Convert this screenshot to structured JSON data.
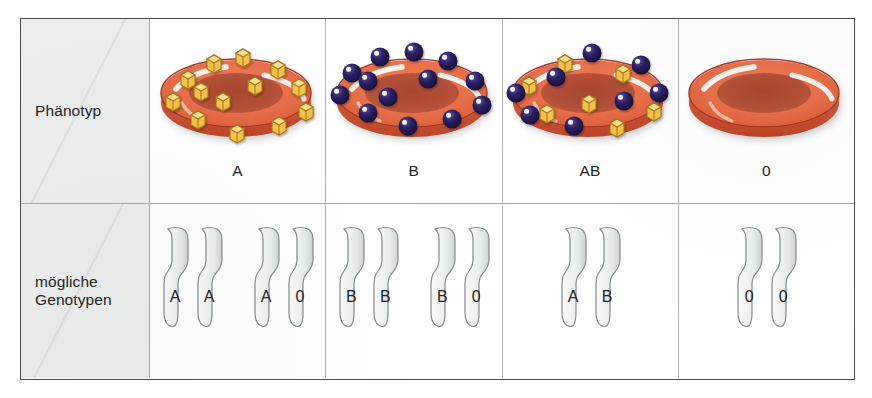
{
  "figure": {
    "rows": [
      {
        "key": "phenotype",
        "label": "Phänotyp"
      },
      {
        "key": "genotype",
        "label": "mögliche\nGenotypen"
      }
    ],
    "row_labels": {
      "phenotype": "Phänotyp",
      "genotype_line1": "mögliche",
      "genotype_line2": "Genotypen"
    },
    "columns": [
      {
        "phenotype": "A",
        "cell_icon": "red-blood-cell-with-a-antigens",
        "antigens": {
          "cubes": 12,
          "spheres": 0
        },
        "genotypes": [
          {
            "alleles": [
              "A",
              "A"
            ]
          },
          {
            "alleles": [
              "A",
              "0"
            ]
          }
        ]
      },
      {
        "phenotype": "B",
        "cell_icon": "red-blood-cell-with-b-antigens",
        "antigens": {
          "cubes": 0,
          "spheres": 13
        },
        "genotypes": [
          {
            "alleles": [
              "B",
              "B"
            ]
          },
          {
            "alleles": [
              "B",
              "0"
            ]
          }
        ]
      },
      {
        "phenotype": "AB",
        "cell_icon": "red-blood-cell-with-ab-antigens",
        "antigens": {
          "cubes": 7,
          "spheres": 8
        },
        "genotypes": [
          {
            "alleles": [
              "A",
              "B"
            ]
          }
        ]
      },
      {
        "phenotype": "0",
        "cell_icon": "red-blood-cell-without-antigens",
        "antigens": {
          "cubes": 0,
          "spheres": 0
        },
        "genotypes": [
          {
            "alleles": [
              "0",
              "0"
            ]
          }
        ]
      }
    ]
  },
  "colors": {
    "cell_body": "#ea7049",
    "cell_body_dark": "#c0482c",
    "cell_rim": "#b8432a",
    "cell_dimple": "#b6523a",
    "cell_highlight": "#ffffff",
    "antigen_cube_face": "#f5c24a",
    "antigen_cube_top": "#fbe08e",
    "antigen_cube_outline": "#a8741a",
    "antigen_sphere": "#221a52",
    "antigen_sphere_highlight": "#ffffff",
    "chromosome_fill": "#eff1f1",
    "chromosome_outline": "#868a8a",
    "label_background": "#eceded",
    "frame_border": "#4a4a4a",
    "grid_line": "#b4b4b7",
    "text": "#232323"
  }
}
